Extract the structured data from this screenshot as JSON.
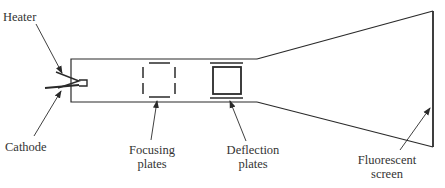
{
  "diagram": {
    "colors": {
      "line": "#2a2a2a",
      "text": "#333333",
      "background": "#ffffff"
    },
    "labels": {
      "heater": "Heater",
      "cathode": "Cathode",
      "focusing": {
        "line1": "Focusing",
        "line2": "plates"
      },
      "deflection": {
        "line1": "Deflection",
        "line2": "plates"
      },
      "screen": {
        "line1": "Fluorescent",
        "line2": "screen"
      }
    },
    "components": [
      "heater",
      "cathode",
      "tube-neck",
      "focusing-plates",
      "deflection-plates",
      "tube-cone",
      "fluorescent-screen"
    ]
  }
}
